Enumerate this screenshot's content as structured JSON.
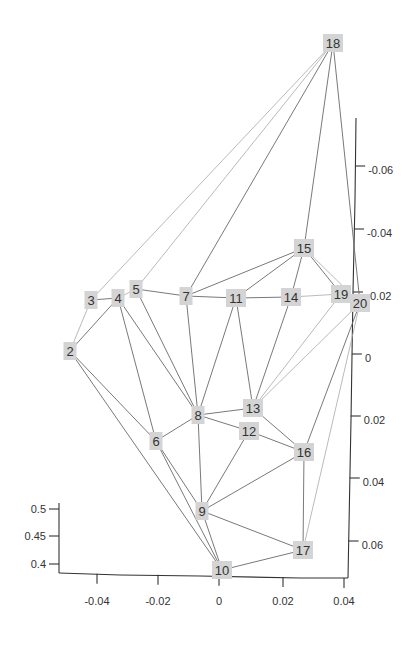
{
  "chart_data": {
    "type": "network-3d",
    "title": "",
    "nodes": [
      {
        "id": "2",
        "x": 70,
        "y": 351
      },
      {
        "id": "3",
        "x": 91,
        "y": 300
      },
      {
        "id": "4",
        "x": 118,
        "y": 298
      },
      {
        "id": "5",
        "x": 136,
        "y": 289
      },
      {
        "id": "6",
        "x": 156,
        "y": 441
      },
      {
        "id": "7",
        "x": 186,
        "y": 296
      },
      {
        "id": "8",
        "x": 198,
        "y": 415
      },
      {
        "id": "9",
        "x": 202,
        "y": 511
      },
      {
        "id": "10",
        "x": 222,
        "y": 570
      },
      {
        "id": "11",
        "x": 236,
        "y": 298
      },
      {
        "id": "12",
        "x": 249,
        "y": 431
      },
      {
        "id": "13",
        "x": 253,
        "y": 408
      },
      {
        "id": "14",
        "x": 291,
        "y": 297
      },
      {
        "id": "15",
        "x": 304,
        "y": 248
      },
      {
        "id": "16",
        "x": 304,
        "y": 452
      },
      {
        "id": "17",
        "x": 303,
        "y": 550
      },
      {
        "id": "18",
        "x": 333,
        "y": 43
      },
      {
        "id": "19",
        "x": 341,
        "y": 294
      },
      {
        "id": "20",
        "x": 360,
        "y": 303
      }
    ],
    "edges": [
      [
        "18",
        "3",
        "light"
      ],
      [
        "18",
        "5",
        "light"
      ],
      [
        "18",
        "7",
        ""
      ],
      [
        "18",
        "15",
        ""
      ],
      [
        "18",
        "20",
        ""
      ],
      [
        "2",
        "3",
        "light"
      ],
      [
        "2",
        "4",
        ""
      ],
      [
        "3",
        "4",
        ""
      ],
      [
        "4",
        "5",
        "light"
      ],
      [
        "5",
        "7",
        ""
      ],
      [
        "7",
        "11",
        ""
      ],
      [
        "11",
        "14",
        ""
      ],
      [
        "14",
        "19",
        "light"
      ],
      [
        "15",
        "7",
        ""
      ],
      [
        "15",
        "11",
        ""
      ],
      [
        "15",
        "14",
        ""
      ],
      [
        "15",
        "19",
        ""
      ],
      [
        "15",
        "20",
        "light"
      ],
      [
        "4",
        "6",
        ""
      ],
      [
        "4",
        "8",
        ""
      ],
      [
        "5",
        "8",
        ""
      ],
      [
        "7",
        "8",
        ""
      ],
      [
        "11",
        "8",
        ""
      ],
      [
        "11",
        "13",
        ""
      ],
      [
        "14",
        "13",
        ""
      ],
      [
        "19",
        "13",
        "light"
      ],
      [
        "20",
        "13",
        "light"
      ],
      [
        "20",
        "16",
        ""
      ],
      [
        "20",
        "17",
        "light"
      ],
      [
        "8",
        "13",
        ""
      ],
      [
        "8",
        "12",
        ""
      ],
      [
        "8",
        "9",
        ""
      ],
      [
        "12",
        "9",
        ""
      ],
      [
        "12",
        "16",
        ""
      ],
      [
        "13",
        "16",
        ""
      ],
      [
        "9",
        "16",
        ""
      ],
      [
        "16",
        "17",
        ""
      ],
      [
        "9",
        "17",
        ""
      ],
      [
        "9",
        "10",
        ""
      ],
      [
        "10",
        "17",
        ""
      ],
      [
        "2",
        "6",
        ""
      ],
      [
        "2",
        "10",
        ""
      ],
      [
        "6",
        "8",
        ""
      ],
      [
        "6",
        "9",
        ""
      ],
      [
        "6",
        "10",
        ""
      ]
    ],
    "axes": {
      "x_axis": {
        "ticks": [
          {
            "label": "-0.04",
            "x": 97
          },
          {
            "label": "-0.02",
            "x": 158
          },
          {
            "label": "0",
            "x": 219
          },
          {
            "label": "0.02",
            "x": 283
          },
          {
            "label": "0.04",
            "x": 344
          }
        ]
      },
      "y_axis_right": {
        "ticks": [
          {
            "label": "-0.06",
            "y": 166
          },
          {
            "label": "-0.04",
            "y": 229
          },
          {
            "label": "0.02",
            "y": 292
          },
          {
            "label": "0",
            "y": 354
          },
          {
            "label": "0.02",
            "y": 416
          },
          {
            "label": "0.04",
            "y": 478
          },
          {
            "label": "0.06",
            "y": 541
          }
        ]
      },
      "z_axis_left": {
        "ticks": [
          {
            "label": "0.5",
            "y": 509
          },
          {
            "label": "0.45",
            "y": 536
          },
          {
            "label": "0.4",
            "y": 564
          }
        ]
      }
    }
  }
}
